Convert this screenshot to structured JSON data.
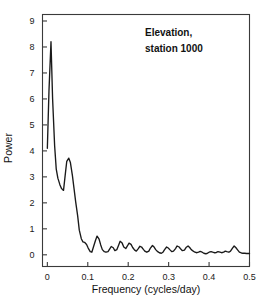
{
  "chart_data": {
    "type": "line",
    "title": "",
    "annotation": [
      "Elevation,",
      "station 1000"
    ],
    "xlabel": "Frequency  (cycles/day)",
    "ylabel": "Power",
    "xlim": [
      -0.012,
      0.5
    ],
    "ylim": [
      -0.45,
      9.25
    ],
    "xticks": [
      0,
      0.1,
      0.2,
      0.3,
      0.4,
      0.5
    ],
    "xticklabels": [
      "0",
      "0.1",
      "0.2",
      "0.3",
      "0.4",
      "0.5"
    ],
    "yticks": [
      0,
      1,
      2,
      3,
      4,
      5,
      6,
      7,
      8,
      9
    ],
    "yticklabels": [
      "0",
      "1",
      "2",
      "3",
      "4",
      "5",
      "6",
      "7",
      "8",
      "9"
    ],
    "grid": false,
    "legend": false,
    "line_color": "#1a1a1a",
    "frame_color": "#3a3a3a",
    "series": [
      {
        "name": "Elevation spectrum, station 1000",
        "x": [
          0.0,
          0.004,
          0.009,
          0.013,
          0.018,
          0.022,
          0.026,
          0.031,
          0.035,
          0.04,
          0.044,
          0.048,
          0.053,
          0.057,
          0.062,
          0.066,
          0.07,
          0.075,
          0.079,
          0.084,
          0.088,
          0.092,
          0.097,
          0.101,
          0.106,
          0.11,
          0.114,
          0.119,
          0.123,
          0.128,
          0.132,
          0.136,
          0.141,
          0.145,
          0.15,
          0.154,
          0.158,
          0.163,
          0.167,
          0.172,
          0.176,
          0.18,
          0.185,
          0.189,
          0.194,
          0.198,
          0.202,
          0.207,
          0.211,
          0.216,
          0.22,
          0.224,
          0.229,
          0.233,
          0.238,
          0.242,
          0.246,
          0.251,
          0.255,
          0.26,
          0.264,
          0.268,
          0.273,
          0.277,
          0.282,
          0.286,
          0.29,
          0.295,
          0.299,
          0.304,
          0.308,
          0.312,
          0.317,
          0.321,
          0.326,
          0.33,
          0.334,
          0.339,
          0.343,
          0.348,
          0.352,
          0.356,
          0.361,
          0.365,
          0.37,
          0.374,
          0.378,
          0.383,
          0.387,
          0.392,
          0.396,
          0.4,
          0.405,
          0.409,
          0.414,
          0.418,
          0.422,
          0.427,
          0.431,
          0.436,
          0.44,
          0.444,
          0.449,
          0.453,
          0.458,
          0.462,
          0.466,
          0.471,
          0.475,
          0.48,
          0.484,
          0.488,
          0.493,
          0.497,
          0.5
        ],
        "y": [
          4.1,
          6.3,
          8.2,
          6.0,
          4.2,
          3.3,
          2.95,
          2.7,
          2.55,
          2.48,
          3.05,
          3.6,
          3.72,
          3.55,
          3.05,
          2.55,
          2.05,
          1.5,
          0.95,
          0.62,
          0.5,
          0.48,
          0.4,
          0.26,
          0.12,
          0.1,
          0.3,
          0.55,
          0.72,
          0.6,
          0.38,
          0.2,
          0.12,
          0.1,
          0.12,
          0.22,
          0.32,
          0.27,
          0.16,
          0.2,
          0.36,
          0.52,
          0.45,
          0.3,
          0.24,
          0.34,
          0.45,
          0.4,
          0.28,
          0.18,
          0.14,
          0.22,
          0.33,
          0.3,
          0.2,
          0.13,
          0.1,
          0.14,
          0.26,
          0.36,
          0.3,
          0.2,
          0.12,
          0.08,
          0.06,
          0.1,
          0.2,
          0.3,
          0.26,
          0.18,
          0.12,
          0.14,
          0.24,
          0.34,
          0.3,
          0.22,
          0.16,
          0.18,
          0.28,
          0.34,
          0.28,
          0.2,
          0.14,
          0.1,
          0.08,
          0.1,
          0.13,
          0.1,
          0.06,
          0.04,
          0.06,
          0.1,
          0.12,
          0.1,
          0.08,
          0.09,
          0.12,
          0.1,
          0.08,
          0.1,
          0.14,
          0.12,
          0.1,
          0.14,
          0.26,
          0.34,
          0.28,
          0.18,
          0.1,
          0.07,
          0.06,
          0.06,
          0.05,
          0.05,
          0.05
        ]
      }
    ]
  }
}
